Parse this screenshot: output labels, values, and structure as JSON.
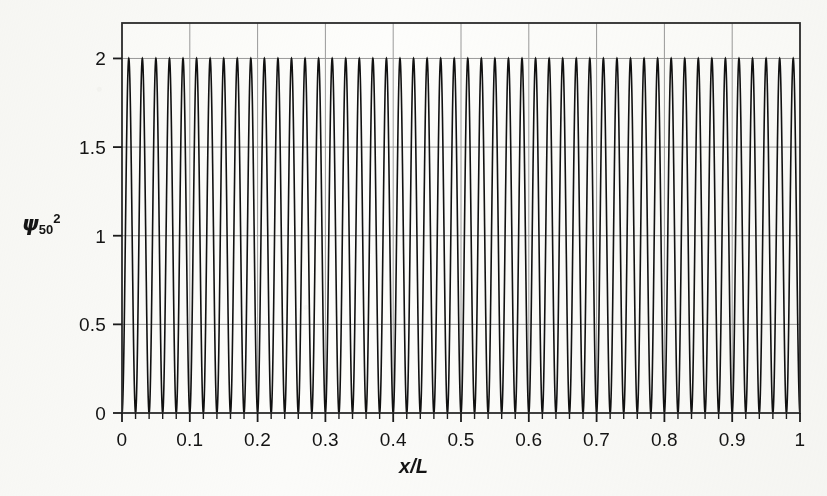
{
  "figure": {
    "background_color": "#fbfbf9",
    "line_color": "#111111",
    "grid_color": "#9a9a9a",
    "frame_color": "#2b2b2b"
  },
  "axes": {
    "y_title_psi": "ψ",
    "y_title_sub": "50",
    "y_title_sup": "2",
    "x_title": "x/L"
  },
  "chart_data": {
    "type": "line",
    "title": "",
    "subtitle": "",
    "xlabel": "x/L",
    "ylabel": "ψ₅₀²",
    "xlim": [
      0,
      1
    ],
    "ylim": [
      0,
      2.2
    ],
    "xticks": [
      0,
      0.1,
      0.2,
      0.3,
      0.4,
      0.5,
      0.6,
      0.7,
      0.8,
      0.9,
      1
    ],
    "xticklabels": [
      "0",
      "0.1",
      "0.2",
      "0.3",
      "0.4",
      "0.5",
      "0.6",
      "0.7",
      "0.8",
      "0.9",
      "1"
    ],
    "x_minor_tick_step": 0.02,
    "yticks": [
      0,
      0.5,
      1,
      1.5,
      2
    ],
    "yticklabels": [
      "0",
      "0.5",
      "1",
      "1.5",
      "2"
    ],
    "grid": "both",
    "grid_x_at": [
      0.1,
      0.2,
      0.3,
      0.4,
      0.5,
      0.6,
      0.7,
      0.8,
      0.9
    ],
    "grid_y_at": [
      0.5,
      1,
      1.5,
      2
    ],
    "legend": null,
    "legend_position": "none",
    "annotations": [],
    "series": [
      {
        "name": "ψ₅₀²",
        "formula": "2*sin(50*pi*x)^2",
        "quantum_number_n": 50,
        "amplitude_max": 2,
        "amplitude_min": 0,
        "n_peaks": 50,
        "peak_value": 2,
        "trough_value": 0,
        "samples": 6000,
        "color": "#111111",
        "linewidth": 1.6
      }
    ]
  }
}
